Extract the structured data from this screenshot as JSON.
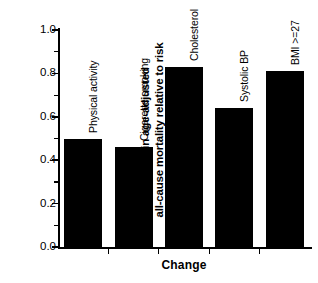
{
  "chart_data": {
    "type": "bar",
    "title": "",
    "xlabel": "Change",
    "ylabel_line1": "Change in age-adjusted",
    "ylabel_line2": "all-cause mortality relative to risk",
    "categories": [
      "Physical activity",
      "Cigarette smoking",
      "Cholesterol",
      "Systolic BP",
      "BMI >=27"
    ],
    "values": [
      0.5,
      0.46,
      0.83,
      0.64,
      0.81
    ],
    "ylim": [
      0.0,
      1.0
    ],
    "ytick_labels": [
      "0.0",
      "0.2",
      "0.4",
      "0.6",
      "0.8",
      "1.0"
    ],
    "ytick_values": [
      0.0,
      0.2,
      0.4,
      0.6,
      0.8,
      1.0
    ],
    "yminor_values": [
      0.1,
      0.3,
      0.5,
      0.7,
      0.9
    ],
    "grid": false,
    "legend": "none",
    "bar_color": "#000000",
    "axis_color": "#000000",
    "label_orientation": "vertical"
  }
}
